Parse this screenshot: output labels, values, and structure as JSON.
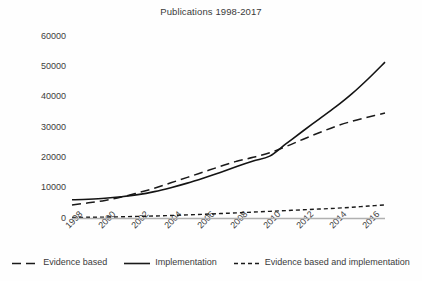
{
  "chart_data": {
    "type": "line",
    "title": "Publications 1998-2017",
    "xlabel": "",
    "ylabel": "",
    "x": [
      1998,
      1999,
      2000,
      2001,
      2002,
      2003,
      2004,
      2005,
      2006,
      2007,
      2008,
      2009,
      2010,
      2011,
      2012,
      2013,
      2014,
      2015,
      2016,
      2017
    ],
    "xtick_labels": [
      "1998",
      "2000",
      "2002",
      "2004",
      "2006",
      "2008",
      "2010",
      "2012",
      "2014",
      "2016"
    ],
    "xticks": [
      1998,
      2000,
      2002,
      2004,
      2006,
      2008,
      2010,
      2012,
      2014,
      2016
    ],
    "ytick_labels": [
      "0",
      "10000",
      "20000",
      "30000",
      "40000",
      "50000",
      "60000"
    ],
    "yticks": [
      0,
      10000,
      20000,
      30000,
      40000,
      50000,
      60000
    ],
    "ylim": [
      0,
      60000
    ],
    "xlim": [
      1998,
      2017
    ],
    "grid": false,
    "legend_position": "bottom",
    "series": [
      {
        "name": "Evidence based",
        "style": "long-dash",
        "color": "#1a1a1a",
        "values": [
          4300,
          5000,
          5800,
          6900,
          8300,
          9800,
          11600,
          13400,
          15200,
          17000,
          18700,
          20000,
          21500,
          23600,
          25900,
          28100,
          30200,
          31900,
          33300,
          34600
        ]
      },
      {
        "name": "Implementation",
        "style": "solid",
        "color": "#141414",
        "values": [
          6000,
          6200,
          6500,
          7000,
          7700,
          8700,
          10000,
          11500,
          13200,
          15000,
          17000,
          18800,
          20400,
          24500,
          28600,
          32600,
          36600,
          41000,
          46000,
          51400
        ]
      },
      {
        "name": "Evidence based and implementation",
        "style": "short-dash",
        "color": "#1a1a1a",
        "values": [
          180,
          230,
          300,
          400,
          520,
          660,
          830,
          1020,
          1230,
          1460,
          1700,
          1950,
          2200,
          2450,
          2700,
          2950,
          3200,
          3550,
          3950,
          4300
        ]
      }
    ]
  },
  "legend": {
    "items": [
      {
        "label": "Evidence based",
        "style": "long-dash"
      },
      {
        "label": "Implementation",
        "style": "solid"
      },
      {
        "label": "Evidence based and implementation",
        "style": "short-dash"
      }
    ]
  }
}
